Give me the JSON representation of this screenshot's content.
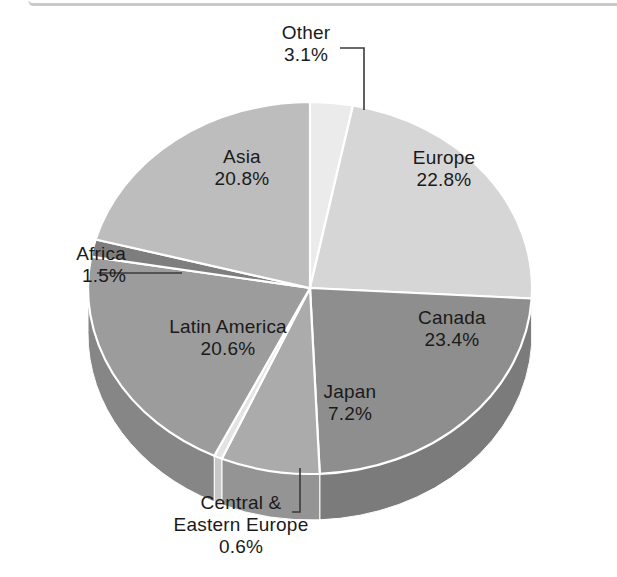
{
  "figure": {
    "background_color": "#ffffff",
    "rule_color": "#c9c9c9"
  },
  "chart_data": {
    "type": "pie",
    "title": "",
    "subtitle": "",
    "xlabel": "",
    "ylabel": "",
    "legend_position": "none",
    "grid": false,
    "style": "3d-pie",
    "value_unit": "percent",
    "start_angle_deg": 0,
    "direction": "clockwise",
    "categories": [
      "Other",
      "Europe",
      "Canada",
      "Japan",
      "Central & Eastern Europe",
      "Latin America",
      "Africa",
      "Asia"
    ],
    "values": [
      3.1,
      22.8,
      23.4,
      7.2,
      0.6,
      20.6,
      1.5,
      20.8
    ],
    "slices": [
      {
        "name": "Other",
        "value": 3.1,
        "label": "Other",
        "value_label": "3.1%",
        "color": "#ebebeb",
        "side_color": "#cfcfcf",
        "label_placement": "callout"
      },
      {
        "name": "Europe",
        "value": 22.8,
        "label": "Europe",
        "value_label": "22.8%",
        "color": "#d6d6d6",
        "side_color": "#bdbdbd",
        "label_placement": "inside"
      },
      {
        "name": "Canada",
        "value": 23.4,
        "label": "Canada",
        "value_label": "23.4%",
        "color": "#8e8e8e",
        "side_color": "#7b7b7b",
        "label_placement": "inside"
      },
      {
        "name": "Japan",
        "value": 7.2,
        "label": "Japan",
        "value_label": "7.2%",
        "color": "#ababab",
        "side_color": "#949494",
        "label_placement": "inside"
      },
      {
        "name": "Central & Eastern Europe",
        "value": 0.6,
        "label_line1": "Central &",
        "label_line2": "Eastern Europe",
        "value_label": "0.6%",
        "color": "#e3e3e3",
        "side_color": "#c8c8c8",
        "label_placement": "callout"
      },
      {
        "name": "Latin America",
        "value": 20.6,
        "label": "Latin America",
        "value_label": "20.6%",
        "color": "#9c9c9c",
        "side_color": "#868686",
        "label_placement": "inside"
      },
      {
        "name": "Africa",
        "value": 1.5,
        "label": "Africa",
        "value_label": "1.5%",
        "color": "#7e7e7e",
        "side_color": "#6e6e6e",
        "label_placement": "callout"
      },
      {
        "name": "Asia",
        "value": 20.8,
        "label": "Asia",
        "value_label": "20.8%",
        "color": "#bdbdbd",
        "side_color": "#a6a6a6",
        "label_placement": "inside"
      }
    ]
  }
}
